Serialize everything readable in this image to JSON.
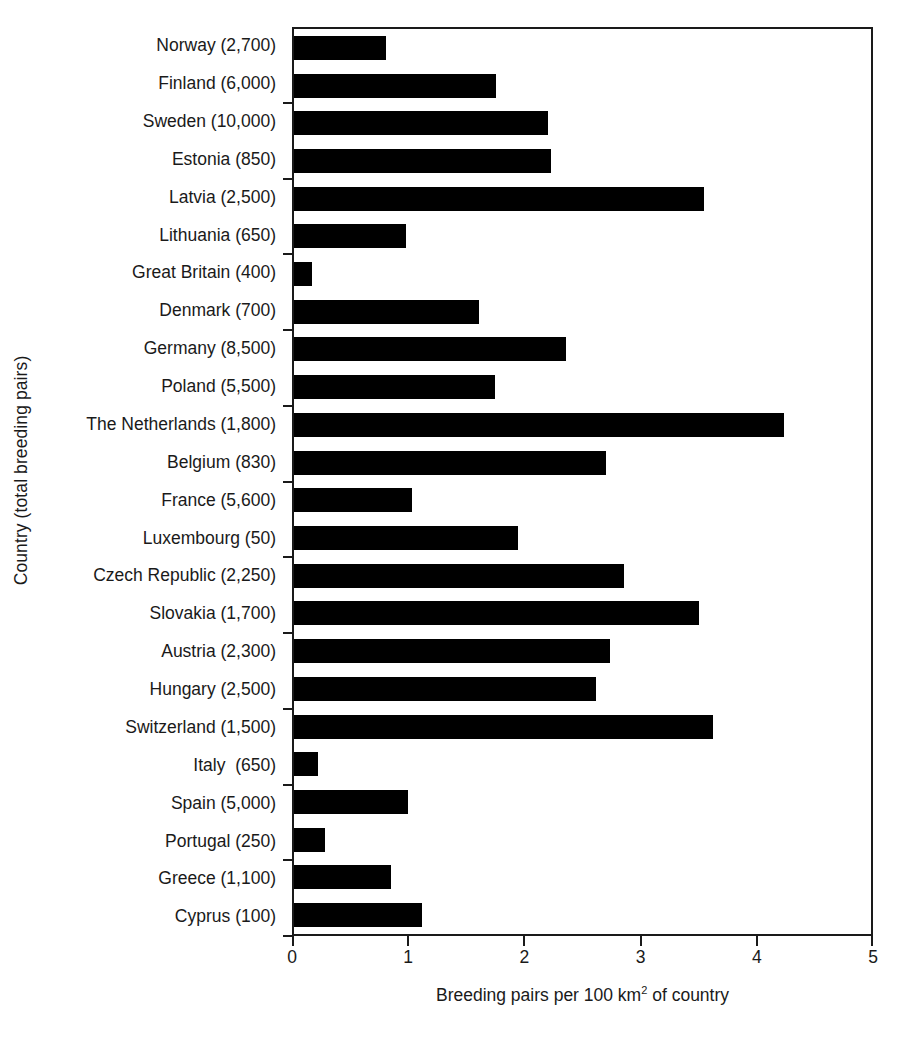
{
  "chart_data": {
    "type": "bar",
    "orientation": "horizontal",
    "title": "",
    "xlabel": "Breeding pairs per 100 km² of country",
    "ylabel": "Country (total breeding pairs)",
    "xlim": [
      0,
      5
    ],
    "xticks": [
      0,
      1,
      2,
      3,
      4,
      5
    ],
    "xtick_labels": [
      "0",
      "1",
      "2",
      "3",
      "4",
      "5"
    ],
    "grid": false,
    "legend": null,
    "bar_color": "#000000",
    "axis_color": "#1a1a1a",
    "categories": [
      "Norway (2,700)",
      "Finland (6,000)",
      "Sweden (10,000)",
      "Estonia (850)",
      "Latvia (2,500)",
      "Lithuania (650)",
      "Great Britain (400)",
      "Denmark (700)",
      "Germany (8,500)",
      "Poland (5,500)",
      "The Netherlands (1,800)",
      "Belgium (830)",
      "France (5,600)",
      "Luxembourg (50)",
      "Czech Republic (2,250)",
      "Slovakia (1,700)",
      "Austria (2,300)",
      "Hungary (2,500)",
      "Switzerland (1,500)",
      "Italy  (650)",
      "Spain (5,000)",
      "Portugal (250)",
      "Greece (1,100)",
      "Cyprus (100)"
    ],
    "country_names": [
      "Norway",
      "Finland",
      "Sweden",
      "Estonia",
      "Latvia",
      "Lithuania",
      "Great Britain",
      "Denmark",
      "Germany",
      "Poland",
      "The Netherlands",
      "Belgium",
      "France",
      "Luxembourg",
      "Czech Republic",
      "Slovakia",
      "Austria",
      "Hungary",
      "Switzerland",
      "Italy",
      "Spain",
      "Portugal",
      "Greece",
      "Cyprus"
    ],
    "total_breeding_pairs": [
      2700,
      6000,
      10000,
      850,
      2500,
      650,
      400,
      700,
      8500,
      5500,
      1800,
      830,
      5600,
      50,
      2250,
      1700,
      2300,
      2500,
      1500,
      650,
      5000,
      250,
      1100,
      100
    ],
    "values": [
      0.8,
      1.75,
      2.2,
      2.23,
      3.55,
      0.97,
      0.16,
      1.6,
      2.36,
      1.74,
      4.25,
      2.7,
      1.02,
      1.94,
      2.86,
      3.51,
      2.74,
      2.62,
      3.63,
      0.21,
      0.99,
      0.27,
      0.84,
      1.11
    ]
  }
}
